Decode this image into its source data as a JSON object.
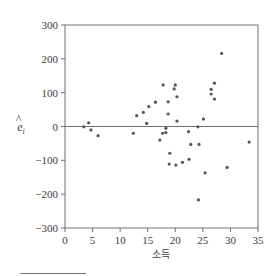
{
  "chart_data": {
    "type": "scatter",
    "title": "",
    "xlabel": "소득",
    "ylabel": "ê_i",
    "ylabel_display": {
      "base": "e",
      "hat": "^",
      "subscript": "i"
    },
    "xlim": [
      0,
      35
    ],
    "ylim": [
      -300,
      300
    ],
    "xticks": [
      0,
      5,
      10,
      15,
      20,
      25,
      30,
      35
    ],
    "yticks": [
      -300,
      -200,
      -100,
      0,
      100,
      200,
      300
    ],
    "xtick_labels": [
      "0",
      "5",
      "10",
      "15",
      "20",
      "25",
      "30",
      "35"
    ],
    "ytick_labels": [
      "−300",
      "−200",
      "−100",
      "0",
      "100",
      "200",
      "300"
    ],
    "reference_line": {
      "y": 0
    },
    "grid": false,
    "legend": null,
    "marker_color": "#555555",
    "axis_color": "#6e6e6e",
    "points": [
      {
        "x": 3.4,
        "y": -1
      },
      {
        "x": 4.3,
        "y": 11
      },
      {
        "x": 4.7,
        "y": -10
      },
      {
        "x": 6.0,
        "y": -27
      },
      {
        "x": 12.4,
        "y": -20
      },
      {
        "x": 13.0,
        "y": 32
      },
      {
        "x": 14.2,
        "y": 42
      },
      {
        "x": 14.8,
        "y": 9
      },
      {
        "x": 15.2,
        "y": 59
      },
      {
        "x": 16.4,
        "y": 72
      },
      {
        "x": 17.2,
        "y": -40
      },
      {
        "x": 17.7,
        "y": -20
      },
      {
        "x": 17.8,
        "y": 123
      },
      {
        "x": 18.3,
        "y": -5
      },
      {
        "x": 18.3,
        "y": -18
      },
      {
        "x": 18.7,
        "y": 73
      },
      {
        "x": 18.7,
        "y": 37
      },
      {
        "x": 19.0,
        "y": -79
      },
      {
        "x": 18.9,
        "y": -111
      },
      {
        "x": 19.8,
        "y": 111
      },
      {
        "x": 20.0,
        "y": 123
      },
      {
        "x": 20.3,
        "y": 88
      },
      {
        "x": 20.3,
        "y": 16
      },
      {
        "x": 20.1,
        "y": -114
      },
      {
        "x": 21.3,
        "y": -106
      },
      {
        "x": 22.4,
        "y": -15
      },
      {
        "x": 22.5,
        "y": -97
      },
      {
        "x": 22.8,
        "y": -53
      },
      {
        "x": 24.3,
        "y": -53
      },
      {
        "x": 24.1,
        "y": -1
      },
      {
        "x": 25.1,
        "y": 22
      },
      {
        "x": 24.2,
        "y": -217
      },
      {
        "x": 25.4,
        "y": -137
      },
      {
        "x": 26.5,
        "y": 110
      },
      {
        "x": 26.5,
        "y": 96
      },
      {
        "x": 27.1,
        "y": 128
      },
      {
        "x": 27.1,
        "y": 81
      },
      {
        "x": 28.4,
        "y": 216
      },
      {
        "x": 29.4,
        "y": -121
      },
      {
        "x": 33.4,
        "y": -46
      }
    ]
  },
  "footnote": {
    "rule_visible": true
  }
}
